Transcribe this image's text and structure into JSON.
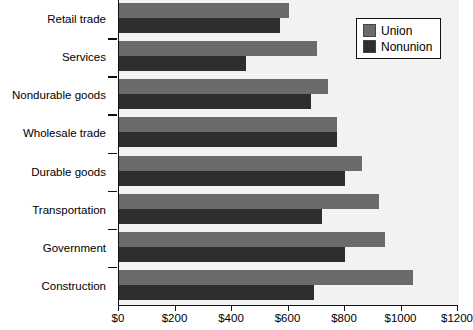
{
  "chart_data": {
    "type": "bar",
    "orientation": "horizontal",
    "title": "",
    "xlabel": "",
    "ylabel": "",
    "xlim": [
      0,
      1200
    ],
    "xticks": [
      0,
      200,
      400,
      600,
      800,
      1000,
      1200
    ],
    "xtick_labels": [
      "$0",
      "$200",
      "$400",
      "$600",
      "$800",
      "$1000",
      "$1200"
    ],
    "grid": true,
    "legend_position": "top-right",
    "categories": [
      "Retail trade",
      "Services",
      "Nondurable goods",
      "Wholesale trade",
      "Durable goods",
      "Transportation",
      "Government",
      "Construction"
    ],
    "series": [
      {
        "name": "Union",
        "color": "#6b6b6b",
        "values": [
          600,
          700,
          740,
          770,
          860,
          920,
          940,
          1040
        ]
      },
      {
        "name": "Nonunion",
        "color": "#2e2e2e",
        "values": [
          570,
          450,
          680,
          770,
          800,
          720,
          800,
          690
        ]
      }
    ]
  },
  "legend": {
    "items": [
      {
        "label": "Union",
        "swatch": "union-swatch"
      },
      {
        "label": "Nonunion",
        "swatch": "nonunion-swatch"
      }
    ]
  },
  "colors": {
    "union": "#6b6b6b",
    "nonunion": "#2e2e2e",
    "band": "#f2f2f2",
    "gridline": "#7a7a7a",
    "axis": "#111111",
    "background": "#ffffff"
  }
}
